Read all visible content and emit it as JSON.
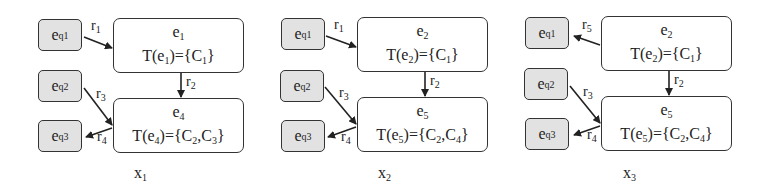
{
  "panels": [
    {
      "caption": "x",
      "caption_sub": "1",
      "query_nodes": [
        {
          "base": "e",
          "sup": "q",
          "sub": "1"
        },
        {
          "base": "e",
          "sup": "q",
          "sub": "2"
        },
        {
          "base": "e",
          "sup": "q",
          "sub": "3"
        }
      ],
      "entity_top": {
        "name": "e",
        "sub": "1",
        "type_prefix": "T(e",
        "type_sub": "1",
        "type_mid": ")={C",
        "type_list": [
          {
            "sub": "1"
          }
        ],
        "type_text": "T(e1)={C1}"
      },
      "entity_bottom": {
        "name": "e",
        "sub": "4",
        "type_text": "T(e4)={C2,C3}"
      },
      "relations": [
        {
          "label": "r",
          "sub": "1",
          "from": "eq1",
          "to": "e1"
        },
        {
          "label": "r",
          "sub": "2",
          "from": "e1",
          "to": "e4"
        },
        {
          "label": "r",
          "sub": "3",
          "from": "eq2",
          "to": "e4"
        },
        {
          "label": "r",
          "sub": "4",
          "from": "e4",
          "to": "eq3"
        }
      ]
    },
    {
      "caption": "x",
      "caption_sub": "2",
      "query_nodes": [
        {
          "base": "e",
          "sup": "q",
          "sub": "1"
        },
        {
          "base": "e",
          "sup": "q",
          "sub": "2"
        },
        {
          "base": "e",
          "sup": "q",
          "sub": "3"
        }
      ],
      "entity_top": {
        "name": "e",
        "sub": "2",
        "type_text": "T(e2)={C1}"
      },
      "entity_bottom": {
        "name": "e",
        "sub": "5",
        "type_text": "T(e5)={C2,C4}"
      },
      "relations": [
        {
          "label": "r",
          "sub": "1",
          "from": "eq1",
          "to": "e2"
        },
        {
          "label": "r",
          "sub": "2",
          "from": "e2",
          "to": "e5"
        },
        {
          "label": "r",
          "sub": "3",
          "from": "eq2",
          "to": "e5"
        },
        {
          "label": "r",
          "sub": "4",
          "from": "e5",
          "to": "eq3"
        }
      ]
    },
    {
      "caption": "x",
      "caption_sub": "3",
      "query_nodes": [
        {
          "base": "e",
          "sup": "q",
          "sub": "1"
        },
        {
          "base": "e",
          "sup": "q",
          "sub": "2"
        },
        {
          "base": "e",
          "sup": "q",
          "sub": "3"
        }
      ],
      "entity_top": {
        "name": "e",
        "sub": "2",
        "type_text": "T(e2)={C1}"
      },
      "entity_bottom": {
        "name": "e",
        "sub": "5",
        "type_text": "T(e5)={C2,C4}"
      },
      "relations": [
        {
          "label": "r",
          "sub": "5",
          "from": "e2",
          "to": "eq1"
        },
        {
          "label": "r",
          "sub": "2",
          "from": "e2",
          "to": "e5"
        },
        {
          "label": "r",
          "sub": "3",
          "from": "eq2",
          "to": "e5"
        },
        {
          "label": "r",
          "sub": "4",
          "from": "e5",
          "to": "eq3"
        }
      ]
    }
  ],
  "types": {
    "p0_top": {
      "pre": "T(e",
      "esub": "1",
      "mid": ")={C",
      "c1": "1",
      "end": "}"
    },
    "p0_bot": {
      "pre": "T(e",
      "esub": "4",
      "mid": ")={C",
      "c1": "2",
      "comma": ",C",
      "c2": "3",
      "end": "}"
    },
    "p1_top": {
      "pre": "T(e",
      "esub": "2",
      "mid": ")={C",
      "c1": "1",
      "end": "}"
    },
    "p1_bot": {
      "pre": "T(e",
      "esub": "5",
      "mid": ")={C",
      "c1": "2",
      "comma": ",C",
      "c2": "4",
      "end": "}"
    },
    "p2_top": {
      "pre": "T(e",
      "esub": "2",
      "mid": ")={C",
      "c1": "1",
      "end": "}"
    },
    "p2_bot": {
      "pre": "T(e",
      "esub": "5",
      "mid": ")={C",
      "c1": "2",
      "comma": ",C",
      "c2": "4",
      "end": "}"
    }
  },
  "colors": {
    "query_fill": "#e2e2e2",
    "border": "#333333",
    "entity_fill": "#ffffff"
  }
}
